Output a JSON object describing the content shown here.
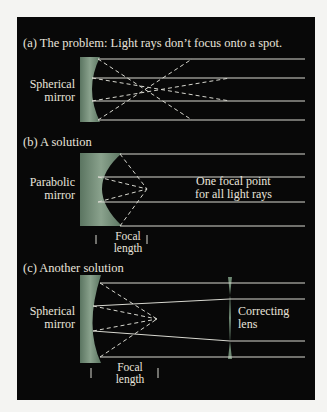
{
  "panels": [
    {
      "id": "a",
      "title": "(a) The problem: Light rays don’t focus onto a spot.",
      "mirror_label": [
        "Spherical",
        "mirror"
      ]
    },
    {
      "id": "b",
      "title": "(b) A solution",
      "mirror_label": [
        "Parabolic",
        "mirror"
      ],
      "note": [
        "One focal point",
        "for all light rays"
      ],
      "dimension_label": [
        "Focal",
        "length"
      ]
    },
    {
      "id": "c",
      "title": "(c) Another solution",
      "mirror_label": [
        "Spherical",
        "mirror"
      ],
      "lens_label": [
        "Correcting",
        "lens"
      ],
      "dimension_label": [
        "Focal",
        "length"
      ]
    }
  ],
  "colors": {
    "background": "#080808",
    "mirror": "#6f8a74",
    "ray": "#d8d8d0",
    "text": "#e8e4dc",
    "page": "#f4f4f2"
  }
}
